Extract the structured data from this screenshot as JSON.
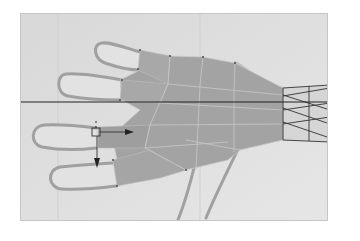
{
  "viewport": {
    "label": "3D modeling viewport",
    "view": "top orthographic",
    "background_color": "#dcdcdc",
    "mesh_fill_color": "#a3a3a3",
    "reference_sketch_color": "#9a9a9a",
    "guide_line_color": "#222222"
  },
  "scene": {
    "reference_image": "hand-sketch",
    "mesh": "low-poly-hand",
    "gizmo": {
      "type": "translate",
      "axes": [
        "x",
        "y"
      ]
    }
  }
}
